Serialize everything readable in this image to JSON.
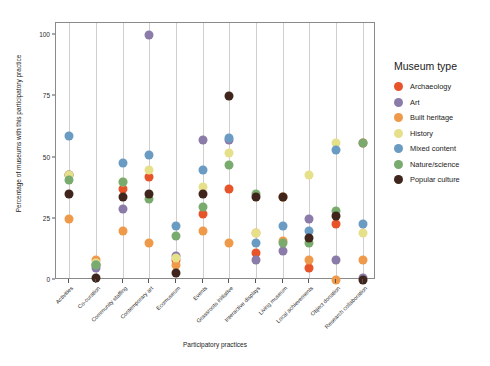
{
  "chart_data": {
    "type": "scatter",
    "title": "",
    "xlabel": "Participatory practices",
    "ylabel": "Percentage of museums with this participatory practice",
    "ylim": [
      0,
      105
    ],
    "yticks": [
      0,
      25,
      50,
      75,
      100
    ],
    "grid": "vertical category lines",
    "legend_title": "Museum type",
    "legend_position": "right",
    "categories": [
      "Activities",
      "Co-curation",
      "Community staffing",
      "Contemporary art",
      "Ecomuseum",
      "Events",
      "Grassroots initiative",
      "Interactive displays",
      "Living museum",
      "Local achievements",
      "Object donation",
      "Research collaboration"
    ],
    "series": [
      {
        "name": "Archaeology",
        "color": "#e8542a",
        "values": [
          43,
          6,
          37,
          42,
          8,
          27,
          37,
          11,
          34,
          5,
          23,
          56
        ]
      },
      {
        "name": "Art",
        "color": "#8b7ba8",
        "values": [
          43,
          5,
          29,
          100,
          10,
          57,
          57,
          8,
          12,
          25,
          8,
          1
        ]
      },
      {
        "name": "Built heritage",
        "color": "#ef9a4a",
        "values": [
          25,
          8,
          20,
          15,
          6,
          20,
          15,
          19,
          16,
          8,
          0,
          8
        ]
      },
      {
        "name": "History",
        "color": "#e6e08a",
        "values": [
          43,
          7,
          40,
          45,
          9,
          38,
          52,
          19,
          34,
          43,
          56,
          19
        ]
      },
      {
        "name": "Mixed content",
        "color": "#6a9bc3",
        "values": [
          59,
          6,
          48,
          51,
          22,
          45,
          58,
          15,
          22,
          20,
          53,
          23
        ]
      },
      {
        "name": "Nature/science",
        "color": "#7aab6e",
        "values": [
          41,
          6,
          40,
          33,
          18,
          30,
          47,
          35,
          15,
          15,
          28,
          56
        ]
      },
      {
        "name": "Popular culture",
        "color": "#40251c",
        "values": [
          35,
          1,
          34,
          35,
          3,
          35,
          75,
          34,
          34,
          17,
          26,
          0
        ]
      }
    ]
  }
}
